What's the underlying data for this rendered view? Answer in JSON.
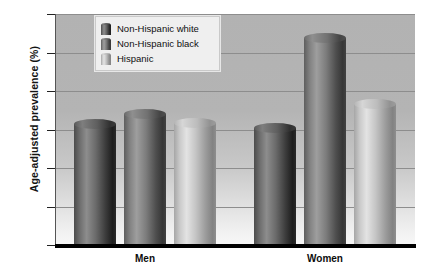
{
  "chart_data": {
    "type": "bar",
    "title": "",
    "subtitle": "",
    "xlabel": "",
    "ylabel": "Age-adjusted prevalence (%)",
    "categories": [
      "Men",
      "Women"
    ],
    "series": [
      {
        "name": "Non-Hispanic white",
        "values": [
          31.4,
          30.5
        ],
        "color": "#3a3a3a"
      },
      {
        "name": "Non-Hispanic black",
        "values": [
          34.0,
          53.9
        ],
        "color": "#565656"
      },
      {
        "name": "Hispanic",
        "values": [
          31.6,
          36.6
        ],
        "color": "#bdbdbd"
      }
    ],
    "ylim": [
      0,
      60
    ],
    "yticks": [
      0,
      10,
      20,
      30,
      40,
      50,
      60
    ],
    "ytick_labels": [
      "0",
      "10.0",
      "20.0",
      "30.0",
      "40.0",
      "50.0",
      "60.0"
    ],
    "grid": true,
    "legend_position": "top-left",
    "legend_entries": [
      "Non-Hispanic white",
      "Non-Hispanic black",
      "Hispanic"
    ],
    "background_color": "#b4b4b4",
    "gridline_color": "#8d8d8d",
    "axis_color": "#000000"
  }
}
